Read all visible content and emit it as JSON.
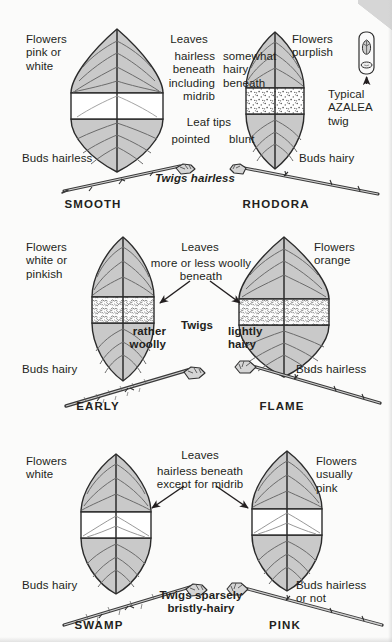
{
  "plate": {
    "title": "Azalea leaf and twig identification plate",
    "colors": {
      "background": "#fbfbfa",
      "ink": "#231f20",
      "leaf_fill": "#c9c9c9",
      "leaf_fill_light": "#d8d8d8",
      "band_white": "#ffffff",
      "twig_fill": "#bfbfbf"
    }
  },
  "panels": [
    {
      "id": "panel-top",
      "divider_note": "Twigs hairless",
      "center": {
        "heading": "Leaves",
        "left_column": "hairless\nbeneath\nincluding\nmidrib",
        "right_column": "somewhat\nhairy\nbeneath",
        "subheading": "Leaf tips",
        "tip_left": "pointed",
        "tip_right": "blunt"
      },
      "left_species": {
        "name": "SMOOTH",
        "flowers": "Flowers\npink or\nwhite",
        "buds": "Buds hairless",
        "band_style": "white"
      },
      "right_species": {
        "name": "RHODORA",
        "flowers": "Flowers\npurplish",
        "buds": "Buds hairy",
        "band_style": "stipple"
      },
      "inset": {
        "caption": "Typical\nAZALEA\ntwig",
        "icon": "azalea-twig-tip"
      }
    },
    {
      "id": "panel-mid",
      "divider_note": "Twigs",
      "center": {
        "heading": "Leaves",
        "body": "more or less woolly\nbeneath",
        "twig_left": "rather\nwoolly",
        "twig_right": "lightly\nhairy"
      },
      "left_species": {
        "name": "EARLY",
        "flowers": "Flowers\nwhite or\npinkish",
        "buds": "Buds hairy",
        "band_style": "woolly"
      },
      "right_species": {
        "name": "FLAME",
        "flowers": "Flowers\norange",
        "buds": "Buds hairless",
        "band_style": "woolly"
      }
    },
    {
      "id": "panel-bot",
      "divider_note": "Twigs sparsely\nbristly-hairy",
      "center": {
        "heading": "Leaves",
        "body": "hairless beneath\nexcept for midrib"
      },
      "left_species": {
        "name": "SWAMP",
        "flowers": "Flowers\nwhite",
        "buds": "Buds hairy",
        "band_style": "white"
      },
      "right_species": {
        "name": "PINK",
        "flowers": "Flowers\nusually\npink",
        "buds": "Buds hairless\nor not",
        "band_style": "white"
      }
    }
  ]
}
